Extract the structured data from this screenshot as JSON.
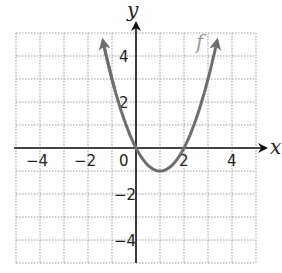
{
  "chart_data": {
    "type": "line",
    "title": "",
    "xlabel": "x",
    "ylabel": "y",
    "xlim": [
      -5,
      5
    ],
    "ylim": [
      -5,
      5
    ],
    "grid": true,
    "x_ticks": [
      -4,
      -2,
      0,
      2,
      4
    ],
    "y_ticks": [
      4,
      2,
      -2,
      -4
    ],
    "x_tick_labels": [
      "−4",
      "−2",
      "0",
      "2",
      "4"
    ],
    "y_tick_labels": [
      "4",
      "2",
      "−2",
      "−4"
    ],
    "series": [
      {
        "name": "f",
        "equation": "f(x) = x^2 - 2x",
        "color": "#6e6e6e",
        "x": [
          -1.5,
          -1,
          0,
          1,
          2,
          3,
          3.5
        ],
        "y": [
          5.25,
          3,
          0,
          -1,
          0,
          3,
          5.25
        ],
        "arrows_at_ends": true
      }
    ],
    "annotations": [
      {
        "text": "f",
        "x": 2.5,
        "y": 4.3
      }
    ]
  }
}
